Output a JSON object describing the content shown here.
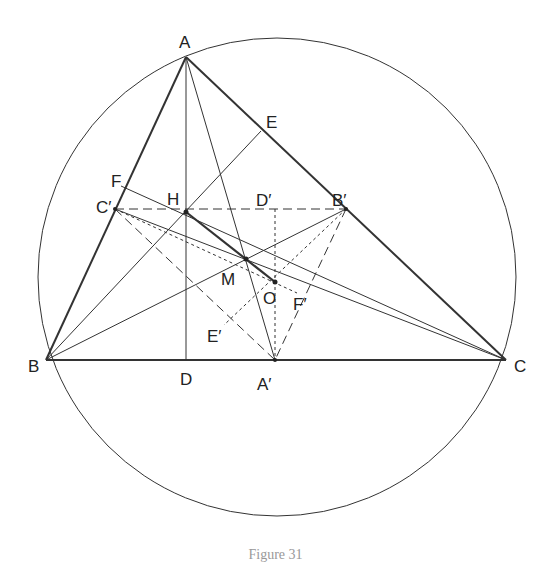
{
  "figure": {
    "type": "geometry-construction",
    "colors": {
      "stroke": "#333333",
      "background": "#ffffff"
    },
    "circle": {
      "cx": 277,
      "cy": 277,
      "r": 239
    },
    "points": {
      "A": {
        "label": "A",
        "x": 186,
        "y": 57
      },
      "B": {
        "label": "B",
        "x": 46,
        "y": 360
      },
      "C": {
        "label": "C",
        "x": 506,
        "y": 360
      },
      "D": {
        "label": "D",
        "x": 186,
        "y": 360
      },
      "E": {
        "label": "E",
        "x": 261,
        "y": 131
      },
      "F": {
        "label": "F",
        "x": 121,
        "y": 186
      },
      "H": {
        "label": "H",
        "x": 186,
        "y": 212
      },
      "O": {
        "label": "O",
        "x": 275,
        "y": 282
      },
      "M": {
        "label": "M",
        "x": 246,
        "y": 259
      },
      "Ap": {
        "label": "A′",
        "x": 275,
        "y": 360
      },
      "Bp": {
        "label": "B′",
        "x": 346,
        "y": 209
      },
      "Cp": {
        "label": "C′",
        "x": 115,
        "y": 209
      },
      "Dp": {
        "label": "D′",
        "x": 275,
        "y": 209
      },
      "Ep": {
        "label": "E′",
        "x": 224,
        "y": 325
      },
      "Fp": {
        "label": "F′",
        "x": 297,
        "y": 293
      }
    },
    "labels": {
      "A": "A",
      "B": "B",
      "C": "C",
      "D": "D",
      "E": "E",
      "F": "F",
      "H": "H",
      "M": "M",
      "O": "O",
      "Ap": "A′",
      "Bp": "B′",
      "Cp": "C′",
      "Dp": "D′",
      "Ep": "E′",
      "Fp": "F′"
    },
    "caption": "Figure 31"
  }
}
